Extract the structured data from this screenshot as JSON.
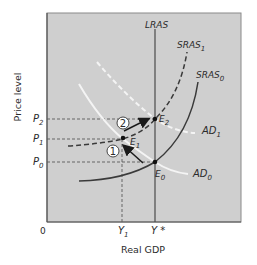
{
  "diagram": {
    "type": "economics-ad-as",
    "axes": {
      "xlabel": "Real GDP",
      "ylabel": "Price level",
      "origin": "0",
      "x_ticks": [
        {
          "label": "Y",
          "sub": "1"
        },
        {
          "label": "Y *",
          "sub": ""
        }
      ],
      "y_ticks": [
        {
          "label": "P",
          "sub": "2"
        },
        {
          "label": "P",
          "sub": "1"
        },
        {
          "label": "P",
          "sub": "0"
        }
      ]
    },
    "curves": {
      "lras": {
        "label": "LRAS"
      },
      "sras1": {
        "label": "SRAS",
        "sub": "1"
      },
      "sras0": {
        "label": "SRAS",
        "sub": "0"
      },
      "ad1": {
        "label": "AD",
        "sub": "1"
      },
      "ad0": {
        "label": "AD",
        "sub": "0"
      }
    },
    "points": {
      "e2": {
        "label": "E",
        "sub": "2"
      },
      "e1": {
        "label": "E",
        "sub": "1"
      },
      "e0": {
        "label": "E",
        "sub": "0"
      }
    },
    "steps": [
      {
        "number": "1"
      },
      {
        "number": "2"
      }
    ],
    "colors": {
      "panel": "#cfcfcf",
      "panel_border": "#6f6f6f",
      "dark_curve": "#3a3a3a",
      "light_curve": "#f4f4f4",
      "guide": "#5a5a5a"
    }
  }
}
